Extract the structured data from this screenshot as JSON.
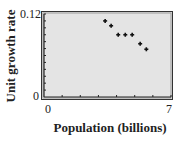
{
  "chart_data": {
    "type": "scatter",
    "title": "",
    "xlabel": "Population (billions)",
    "ylabel": "Unit growth rate",
    "xlim": [
      0,
      7
    ],
    "ylim": [
      0,
      0.12
    ],
    "x_tick_labels": [
      "0",
      "7"
    ],
    "y_tick_labels": [
      "0",
      "0.12"
    ],
    "x_minor_ticks": 7,
    "y_minor_ticks": 12,
    "grid": false,
    "legend": null,
    "marker": "plus",
    "series": [
      {
        "name": "data",
        "x": [
          3.37,
          3.7,
          4.09,
          4.48,
          4.86,
          5.3,
          5.64
        ],
        "y": [
          0.11,
          0.103,
          0.09,
          0.09,
          0.09,
          0.077,
          0.069
        ]
      }
    ]
  },
  "colors": {
    "plot_background": "#e4e4e4",
    "frame": "#333333",
    "marker": "#111111"
  }
}
